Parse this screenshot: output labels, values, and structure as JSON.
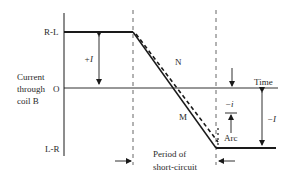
{
  "diagram": {
    "y_axis": {
      "label_lines": [
        "Current",
        "through",
        "coil B"
      ],
      "top_level": "R-L",
      "origin": "O",
      "bottom_level": "L-R"
    },
    "x_axis": {
      "label": "Time"
    },
    "curves": {
      "solid": "M",
      "dashed": "N"
    },
    "annotations": {
      "plus_I": "+I",
      "minus_I": "−I",
      "minus_i": "−i",
      "arc": "Arc",
      "period_line1": "Period of",
      "period_line2": "short-circuit"
    },
    "colors": {
      "line": "#1a1a1a",
      "dashed": "#555555",
      "text": "#2a2a2a",
      "background": "#ffffff"
    }
  }
}
